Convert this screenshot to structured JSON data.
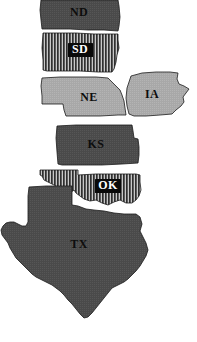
{
  "figure": {
    "name": "great-plains-states-map",
    "background_color": "#ffffff",
    "width": 197,
    "height": 342
  },
  "legend_fills": {
    "solid_dark_gray": "#4a4a4a",
    "light_gray": "#a8a8a8",
    "striped_dark": "#3a3a3a",
    "striped_light": "#c8c8c8",
    "outline": "#1a1a1a",
    "label_text_dark": "#0d0d0d",
    "label_text_light": "#ffffff",
    "label_box": "#0a0a0a"
  },
  "states": [
    {
      "code": "ND",
      "name": "North Dakota",
      "fill_style": "solid-dark-gray",
      "fill_color": "#4a4a4a",
      "label_style": "plain-dark",
      "label_x": 79,
      "label_y": 13
    },
    {
      "code": "SD",
      "name": "South Dakota",
      "fill_style": "vertical-stripes",
      "fill_color": "#3a3a3a",
      "label_style": "boxed-white",
      "label_x": 80,
      "label_y": 50
    },
    {
      "code": "NE",
      "name": "Nebraska",
      "fill_style": "light-gray",
      "fill_color": "#a8a8a8",
      "label_style": "plain-dark",
      "label_x": 89,
      "label_y": 98
    },
    {
      "code": "IA",
      "name": "Iowa",
      "fill_style": "light-gray",
      "fill_color": "#a8a8a8",
      "label_style": "plain-dark",
      "label_x": 152,
      "label_y": 95
    },
    {
      "code": "KS",
      "name": "Kansas",
      "fill_style": "solid-dark-gray",
      "fill_color": "#4a4a4a",
      "label_style": "plain-dark",
      "label_x": 96,
      "label_y": 145
    },
    {
      "code": "OK",
      "name": "Oklahoma",
      "fill_style": "vertical-stripes",
      "fill_color": "#3a3a3a",
      "label_style": "boxed-white",
      "label_x": 108,
      "label_y": 186
    },
    {
      "code": "TX",
      "name": "Texas",
      "fill_style": "solid-dark-gray",
      "fill_color": "#4a4a4a",
      "label_style": "plain-dark",
      "label_x": 79,
      "label_y": 245
    }
  ]
}
